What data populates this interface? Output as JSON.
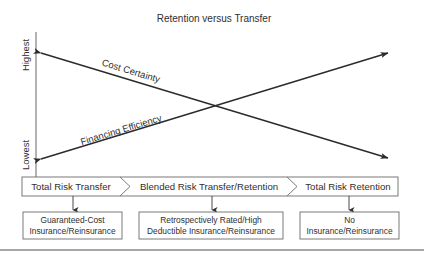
{
  "title": "Retention versus Transfer",
  "y_axis": {
    "high_label": "Highest",
    "low_label": "Lowest"
  },
  "lines": {
    "cost_certainty": "Cost Certainty",
    "financing_efficiency": "Financing Efficiency"
  },
  "stages": [
    {
      "label": "Total Risk Transfer"
    },
    {
      "label": "Blended Risk Transfer/Retention"
    },
    {
      "label": "Total Risk Retention"
    }
  ],
  "outcomes": [
    {
      "line1": "Guaranteed-Cost",
      "line2": "Insurance/Reinsurance"
    },
    {
      "line1": "Retrospectively Rated/High",
      "line2": "Deductible Insurance/Reinsurance"
    },
    {
      "line1": "No",
      "line2": "Insurance/Reinsurance"
    }
  ],
  "colors": {
    "ink": "#2f2f2f",
    "box_border": "#6a6a6a",
    "rule": "#8a8a8a"
  }
}
